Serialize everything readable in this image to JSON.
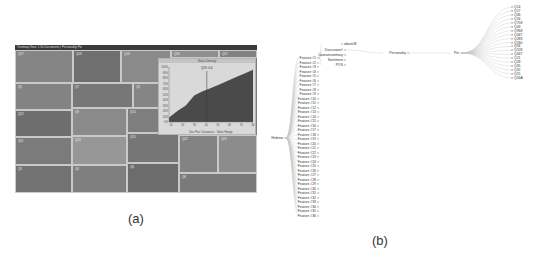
{
  "panel_a": {
    "caption": "(a)",
    "window_title": "Treemap View: 1.5k Documents | Personality Pie",
    "cells": [
      {
        "label": "Q17",
        "x": 0,
        "y": 5,
        "w": 58,
        "h": 33,
        "color": "#858585"
      },
      {
        "label": "Q18",
        "x": 58,
        "y": 5,
        "w": 48,
        "h": 33,
        "color": "#6f6f6f"
      },
      {
        "label": "Q19",
        "x": 106,
        "y": 5,
        "w": 50,
        "h": 33,
        "color": "#8a8a8a"
      },
      {
        "label": "Q20",
        "x": 156,
        "y": 5,
        "w": 48,
        "h": 8,
        "color": "#8f8f8f"
      },
      {
        "label": "Q21",
        "x": 204,
        "y": 5,
        "w": 38,
        "h": 8,
        "color": "#828282"
      },
      {
        "label": "Q5",
        "x": 0,
        "y": 38,
        "w": 57,
        "h": 27,
        "color": "#838383"
      },
      {
        "label": "Q7",
        "x": 57,
        "y": 38,
        "w": 61,
        "h": 25,
        "color": "#777777"
      },
      {
        "label": "Q2",
        "x": 118,
        "y": 38,
        "w": 38,
        "h": 25,
        "color": "#858585"
      },
      {
        "label": "Q12",
        "x": 0,
        "y": 65,
        "w": 57,
        "h": 27,
        "color": "#6e6e6e"
      },
      {
        "label": "Q9",
        "x": 57,
        "y": 63,
        "w": 55,
        "h": 28,
        "color": "#8a8a8a"
      },
      {
        "label": "Q14",
        "x": 112,
        "y": 63,
        "w": 44,
        "h": 25,
        "color": "#7e7e7e"
      },
      {
        "label": "Q11",
        "x": 0,
        "y": 92,
        "w": 57,
        "h": 28,
        "color": "#7b7b7b"
      },
      {
        "label": "Q13",
        "x": 57,
        "y": 91,
        "w": 55,
        "h": 29,
        "color": "#979797"
      },
      {
        "label": "Q15",
        "x": 112,
        "y": 88,
        "w": 52,
        "h": 30,
        "color": "#767676"
      },
      {
        "label": "Q22",
        "x": 164,
        "y": 90,
        "w": 39,
        "h": 38,
        "color": "#838383"
      },
      {
        "label": "Q23",
        "x": 203,
        "y": 90,
        "w": 39,
        "h": 38,
        "color": "#8c8c8c"
      },
      {
        "label": "Q3",
        "x": 0,
        "y": 120,
        "w": 57,
        "h": 28,
        "color": "#727272"
      },
      {
        "label": "Q4",
        "x": 57,
        "y": 120,
        "w": 55,
        "h": 28,
        "color": "#7f7f7f"
      },
      {
        "label": "Q6",
        "x": 112,
        "y": 118,
        "w": 52,
        "h": 30,
        "color": "#6c6c6c"
      },
      {
        "label": "Q8",
        "x": 164,
        "y": 128,
        "w": 78,
        "h": 20,
        "color": "#7a7a7a"
      }
    ],
    "inset_chart": {
      "title": "Value Density",
      "tooltip": "Q19: 0.6",
      "xlabel": "Doc Pos / Instances - Value Range"
    }
  },
  "chart_data": {
    "type": "area",
    "title": "Value Density",
    "xlabel": "Doc Pos / Instances - Value Range",
    "ylabel": "",
    "x": [
      0,
      10,
      20,
      30,
      40,
      50,
      60,
      70,
      80,
      90,
      100
    ],
    "values": [
      8,
      20,
      30,
      48,
      56,
      62,
      68,
      75,
      82,
      88,
      95
    ],
    "ylim": [
      0,
      100
    ],
    "y_ticks": [
      "0%",
      "10%",
      "20%",
      "30%",
      "40%",
      "50%",
      "60%",
      "70%",
      "80%",
      "90%",
      "100%"
    ],
    "x_ticks": [
      "10",
      "20",
      "30",
      "40",
      "50",
      "60",
      "70",
      "80"
    ],
    "marker_x": 45,
    "grid": false
  },
  "panel_b": {
    "caption": "(b)",
    "root": {
      "label": "Hebrew"
    },
    "features": [
      "Feature #1",
      "Feature #2",
      "Feature #3",
      "Feature #4",
      "Feature #5",
      "Feature #6",
      "Feature #7",
      "Feature #8",
      "Feature #9",
      "Feature #10",
      "Feature #11",
      "Feature #12",
      "Feature #13",
      "Feature #14",
      "Feature #15",
      "Feature #16",
      "Feature #17",
      "Feature #18",
      "Feature #19",
      "Feature #20",
      "Feature #21",
      "Feature #22",
      "Feature #23",
      "Feature #24",
      "Feature #25",
      "Feature #26",
      "Feature #27",
      "Feature #28",
      "Feature #29",
      "Feature #30",
      "Feature #31",
      "Feature #32",
      "Feature #33",
      "Feature #34",
      "Feature #35",
      "Feature #36"
    ],
    "sub_nodes": [
      "above/B",
      "Discussion#",
      "Cannotsummary",
      "Sentiment",
      "POS"
    ],
    "personality": {
      "label": "Personality"
    },
    "pie": {
      "label": "Pie"
    },
    "pie_leaves": [
      "Q14",
      "Q17",
      "Q36",
      "Q16",
      "Q758",
      "Q43",
      "Q968",
      "Q347",
      "Q283",
      "Q180",
      "Q34",
      "Q528",
      "Q347",
      "Q21",
      "Q28",
      "Q35",
      "Q32",
      "Q15",
      "Q16A"
    ]
  }
}
